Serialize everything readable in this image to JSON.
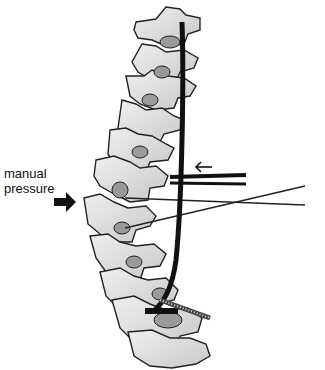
{
  "figure": {
    "type": "medical-illustration",
    "labels": {
      "line1": "manual",
      "line2": "pressure"
    },
    "arrows": [
      {
        "name": "manual-pressure-arrow",
        "direction": "right"
      },
      {
        "name": "rod-push-arrow",
        "direction": "left",
        "glyph": "←"
      }
    ],
    "colors": {
      "bone_fill": "#dcdcdc",
      "bone_outline": "#222222",
      "disc_fill": "#9a9a9a",
      "rod": "#111111",
      "background": "#ffffff"
    }
  }
}
